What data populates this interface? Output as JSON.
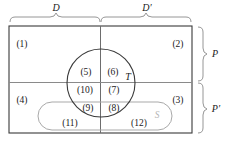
{
  "figure": {
    "colors": {
      "outline": "#3a3a3a",
      "divider": "#8a8a8a",
      "circle": "#3a3a3a",
      "stadium": "#a9a9a9",
      "brace": "#8a8a8a",
      "text": "#1a1a1a",
      "faint_text": "#b6b6b6",
      "background": "#ffffff"
    }
  },
  "braces": {
    "top_left": {
      "label": "D",
      "name": "brace-label-d"
    },
    "top_right": {
      "label": "D′",
      "name": "brace-label-d-prime"
    },
    "right_top": {
      "label": "P",
      "name": "brace-label-p"
    },
    "right_bottom": {
      "label": "P′",
      "name": "brace-label-p-prime"
    }
  },
  "set_labels": [
    {
      "id": "T",
      "label": "T",
      "x": 128,
      "y": 77,
      "faint": false
    },
    {
      "id": "S",
      "label": "S",
      "x": 157,
      "y": 116,
      "faint": true
    }
  ],
  "regions": [
    {
      "id": "r1",
      "label": "(1)",
      "x": 22,
      "y": 45
    },
    {
      "id": "r2",
      "label": "(2)",
      "x": 178,
      "y": 45
    },
    {
      "id": "r3",
      "label": "(3)",
      "x": 178,
      "y": 101
    },
    {
      "id": "r4",
      "label": "(4)",
      "x": 22,
      "y": 101
    },
    {
      "id": "r5",
      "label": "(5)",
      "x": 86,
      "y": 73
    },
    {
      "id": "r6",
      "label": "(6)",
      "x": 113,
      "y": 73
    },
    {
      "id": "r7",
      "label": "(7)",
      "x": 114,
      "y": 91
    },
    {
      "id": "r8",
      "label": "(8)",
      "x": 114,
      "y": 109
    },
    {
      "id": "r9",
      "label": "(9)",
      "x": 88,
      "y": 109
    },
    {
      "id": "r10",
      "label": "(10)",
      "x": 85,
      "y": 91
    },
    {
      "id": "r11",
      "label": "(11)",
      "x": 70,
      "y": 124
    },
    {
      "id": "r12",
      "label": "(12)",
      "x": 139,
      "y": 124
    }
  ],
  "geometry": {
    "rect": {
      "x": 9,
      "y": 26,
      "width": 183,
      "height": 107
    },
    "vertical_divider_x": 100,
    "horizontal_divider_y": 82,
    "circle": {
      "cx": 101,
      "cy": 83,
      "r": 34
    },
    "stadium": {
      "x": 38,
      "y": 102,
      "width": 134,
      "height": 28,
      "radius": 14
    }
  }
}
